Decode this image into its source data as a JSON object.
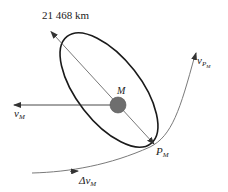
{
  "diagram": {
    "distance_label": "21 468 km",
    "planet_label": "M",
    "velocity_planet": {
      "symbol": "v",
      "subscript": "M"
    },
    "periapsis": {
      "symbol": "P",
      "subscript": "M"
    },
    "velocity_periapsis": {
      "symbol": "v",
      "subscript": "P",
      "subsubscript": "M"
    },
    "delta_v": {
      "symbol": "Δv",
      "subscript": "M"
    },
    "colors": {
      "orbit": "#1a1a1a",
      "planet_fill": "#6e6e6e",
      "trajectory": "#7a7a7a",
      "arrows": "#333333",
      "text": "#222222"
    }
  }
}
